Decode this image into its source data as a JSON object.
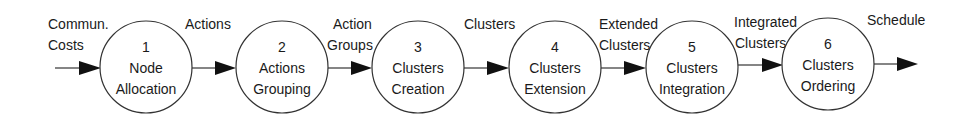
{
  "diagram": {
    "type": "process-flow",
    "colors": {
      "stroke": "#333333",
      "arrow": "#111111",
      "text": "#1a1a1a",
      "background": "#ffffff"
    },
    "nodes": [
      {
        "number": "1",
        "line1": "Node",
        "line2": "Allocation"
      },
      {
        "number": "2",
        "line1": "Actions",
        "line2": "Grouping"
      },
      {
        "number": "3",
        "line1": "Clusters",
        "line2": "Creation"
      },
      {
        "number": "4",
        "line1": "Clusters",
        "line2": "Extension"
      },
      {
        "number": "5",
        "line1": "Clusters",
        "line2": "Integration"
      },
      {
        "number": "6",
        "line1": "Clusters",
        "line2": "Ordering"
      }
    ],
    "edges": [
      {
        "line1": "Commun.",
        "line2": "Costs"
      },
      {
        "line1": "Actions",
        "line2": ""
      },
      {
        "line1": "Action",
        "line2": "Groups"
      },
      {
        "line1": "Clusters",
        "line2": ""
      },
      {
        "line1": "Extended",
        "line2": "Clusters"
      },
      {
        "line1": "Integrated",
        "line2": "Clusters"
      },
      {
        "line1": "Schedule",
        "line2": ""
      }
    ]
  }
}
